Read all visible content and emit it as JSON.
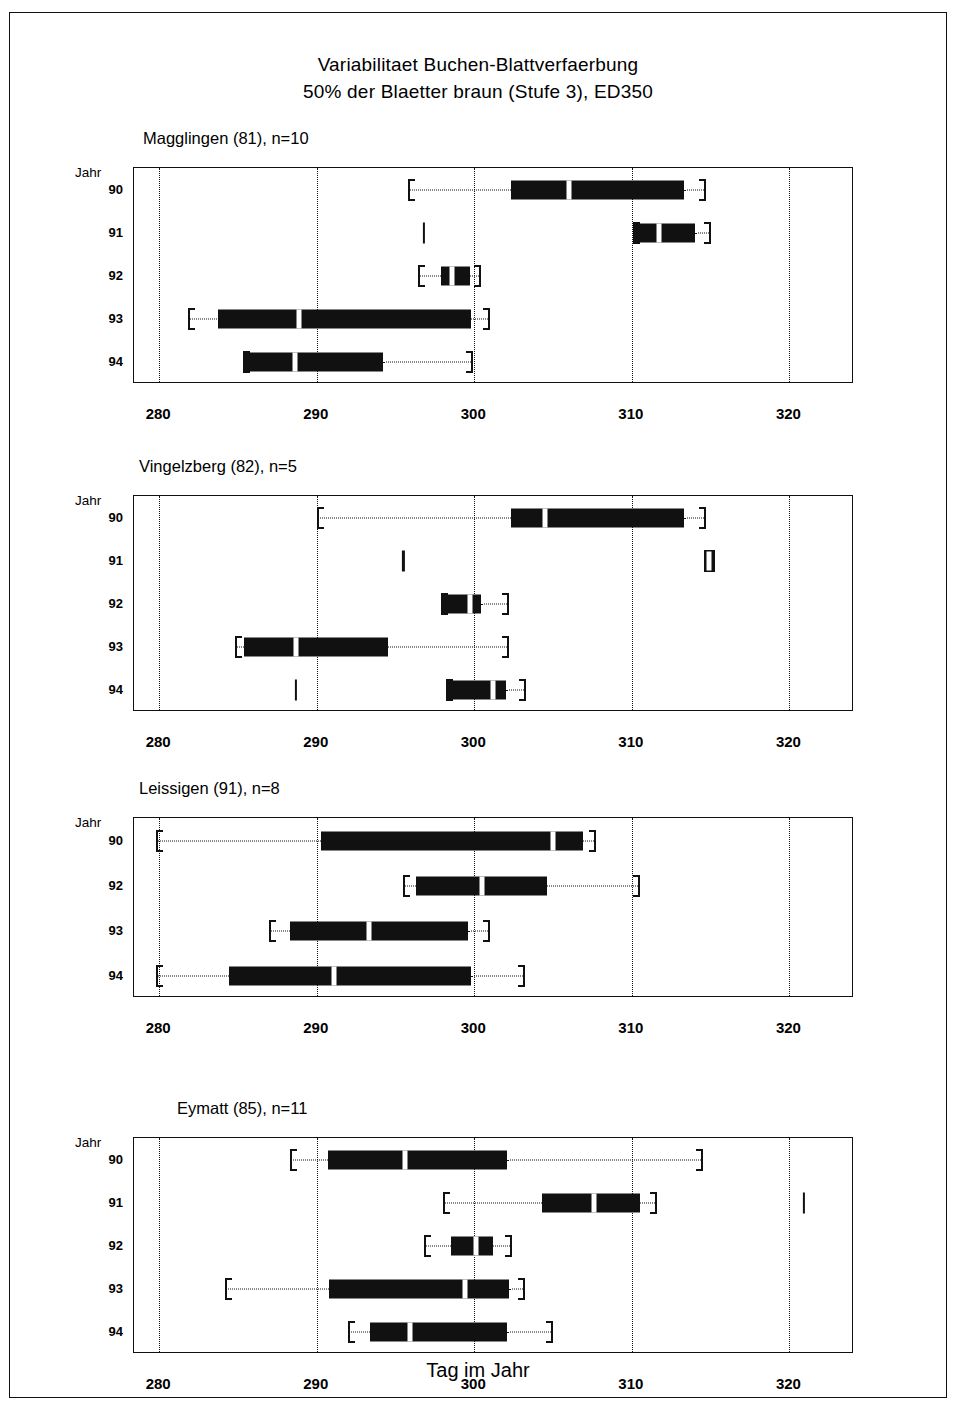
{
  "figure": {
    "title_line1": "Variabilitaet Buchen-Blattverfaerbung",
    "title_line2": "50% der Blaetter braun (Stufe 3), ED350",
    "x_axis_title": "Tag im Jahr",
    "y_axis_corner_label": "Jahr"
  },
  "chart_data": {
    "type": "boxplot",
    "xlabel": "Tag im Jahr",
    "ylabel": "Jahr",
    "xlim": [
      278.4,
      324.1
    ],
    "xticks": [
      280,
      290,
      300,
      310,
      320
    ],
    "xtick_labels": [
      "280",
      "290",
      "300",
      "310",
      "320"
    ],
    "grid": "vertical-dotted-at-xticks",
    "legend": "none",
    "panels": [
      {
        "name": "Magglingen (81), n=10",
        "site": "Magglingen",
        "site_code": "81",
        "n": 10,
        "categories": [
          "90",
          "91",
          "92",
          "93",
          "94"
        ],
        "boxes": [
          {
            "year": "90",
            "whisker_low": 295.8,
            "q1": 302.3,
            "median": 306.0,
            "q3": 313.3,
            "whisker_high": 314.7,
            "outliers": []
          },
          {
            "year": "91",
            "whisker_low": 310.1,
            "q1": 310.1,
            "median": 311.7,
            "q3": 314.0,
            "whisker_high": 315.0,
            "outliers": [
              296.8
            ]
          },
          {
            "year": "92",
            "whisker_low": 296.4,
            "q1": 297.9,
            "median": 298.6,
            "q3": 299.7,
            "whisker_high": 300.4,
            "outliers": []
          },
          {
            "year": "93",
            "whisker_low": 281.8,
            "q1": 283.7,
            "median": 288.9,
            "q3": 299.8,
            "whisker_high": 301.0,
            "outliers": []
          },
          {
            "year": "94",
            "whisker_low": 285.3,
            "q1": 285.3,
            "median": 288.6,
            "q3": 294.2,
            "whisker_high": 299.9,
            "outliers": []
          }
        ]
      },
      {
        "name": "Vingelzberg (82), n=5",
        "site": "Vingelzberg",
        "site_code": "82",
        "n": 5,
        "categories": [
          "90",
          "91",
          "92",
          "93",
          "94"
        ],
        "boxes": [
          {
            "year": "90",
            "whisker_low": 290.0,
            "q1": 302.3,
            "median": 304.5,
            "q3": 313.3,
            "whisker_high": 314.7,
            "outliers": []
          },
          {
            "year": "91",
            "whisker_low": 314.6,
            "q1": 314.6,
            "median": 314.9,
            "q3": 315.3,
            "whisker_high": 315.3,
            "outliers": [
              295.5
            ]
          },
          {
            "year": "92",
            "whisker_low": 297.9,
            "q1": 297.9,
            "median": 299.7,
            "q3": 300.4,
            "whisker_high": 302.2,
            "outliers": []
          },
          {
            "year": "93",
            "whisker_low": 284.8,
            "q1": 285.4,
            "median": 288.7,
            "q3": 294.5,
            "whisker_high": 302.2,
            "outliers": []
          },
          {
            "year": "94",
            "whisker_low": 298.2,
            "q1": 298.2,
            "median": 301.2,
            "q3": 302.0,
            "whisker_high": 303.3,
            "outliers": [
              288.7
            ]
          }
        ]
      },
      {
        "name": "Leissigen (91), n=8",
        "site": "Leissigen",
        "site_code": "91",
        "n": 8,
        "categories": [
          "90",
          "92",
          "93",
          "94"
        ],
        "boxes": [
          {
            "year": "90",
            "whisker_low": 279.8,
            "q1": 290.3,
            "median": 305.0,
            "q3": 306.9,
            "whisker_high": 307.7,
            "outliers": []
          },
          {
            "year": "92",
            "whisker_low": 295.5,
            "q1": 296.3,
            "median": 300.5,
            "q3": 304.6,
            "whisker_high": 310.5,
            "outliers": []
          },
          {
            "year": "93",
            "whisker_low": 287.0,
            "q1": 288.3,
            "median": 293.3,
            "q3": 299.6,
            "whisker_high": 301.0,
            "outliers": []
          },
          {
            "year": "94",
            "whisker_low": 279.8,
            "q1": 284.4,
            "median": 291.1,
            "q3": 299.8,
            "whisker_high": 303.2,
            "outliers": []
          }
        ]
      },
      {
        "name": "Eymatt (85), n=11",
        "site": "Eymatt",
        "site_code": "85",
        "n": 11,
        "categories": [
          "90",
          "91",
          "92",
          "93",
          "94"
        ],
        "boxes": [
          {
            "year": "90",
            "whisker_low": 288.3,
            "q1": 290.7,
            "median": 295.6,
            "q3": 302.1,
            "whisker_high": 314.5,
            "outliers": []
          },
          {
            "year": "91",
            "whisker_low": 298.0,
            "q1": 304.3,
            "median": 307.6,
            "q3": 310.5,
            "whisker_high": 311.6,
            "outliers": [
              320.9
            ]
          },
          {
            "year": "92",
            "whisker_low": 296.8,
            "q1": 298.5,
            "median": 300.1,
            "q3": 301.2,
            "whisker_high": 302.4,
            "outliers": []
          },
          {
            "year": "93",
            "whisker_low": 284.2,
            "q1": 290.8,
            "median": 299.4,
            "q3": 302.2,
            "whisker_high": 303.2,
            "outliers": []
          },
          {
            "year": "94",
            "whisker_low": 292.0,
            "q1": 293.4,
            "median": 295.9,
            "q3": 302.1,
            "whisker_high": 305.0,
            "outliers": []
          }
        ]
      }
    ]
  }
}
